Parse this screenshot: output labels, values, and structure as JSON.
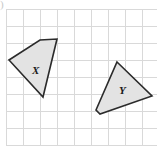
{
  "figure": {
    "name": "two-congruent-quadrilaterals-on-grid",
    "width": 159,
    "height": 154,
    "background_color": "#ffffff",
    "corner_mark": ")",
    "grid": {
      "line_color": "#d9d9d9",
      "cell_size": 17,
      "origin_x": 6,
      "origin_y": 9,
      "columns": 8,
      "rows": 8,
      "vertical_lines": [
        6,
        23,
        40,
        57,
        74,
        91,
        108,
        125,
        142
      ],
      "horizontal_lines": [
        9,
        26,
        43,
        60,
        77,
        94,
        111,
        128,
        145
      ]
    },
    "shapes": [
      {
        "label": "X",
        "fill_color": "#e3e3e3",
        "stroke_color": "#2b2b2b",
        "points": "9,60 40,40 57,39 43,97",
        "label_x": 32,
        "label_y": 74
      },
      {
        "label": "Y",
        "fill_color": "#e3e3e3",
        "stroke_color": "#2b2b2b",
        "points": "117,62 152,96 100,114 96,110",
        "label_x": 119,
        "label_y": 94
      }
    ]
  }
}
